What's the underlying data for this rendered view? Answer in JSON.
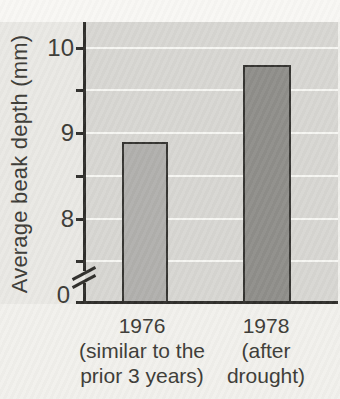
{
  "chart_data": {
    "type": "bar",
    "title": "",
    "xlabel": "",
    "ylabel": "Average beak depth (mm)",
    "categories": [
      "1976 (similar to the prior 3 years)",
      "1978 (after drought)"
    ],
    "values": [
      8.9,
      9.8
    ],
    "y_major_ticks": [
      10,
      9,
      8
    ],
    "y_minor_ticks": [
      9.5,
      8.5,
      7.5
    ],
    "baseline_tick_label": "0",
    "axis_break": "y-axis broken between 0 and 7.5",
    "ylim_shown": [
      7.5,
      10.3
    ],
    "grid": "white horizontal gridlines every 0.5 units on gray plot panel",
    "legend": "none",
    "bar_colors": [
      "#b0afac",
      "#8e8d89"
    ]
  },
  "y_axis": {
    "title": "Average beak depth (mm)",
    "zero_label": "0"
  },
  "x_axis": {
    "categories": [
      [
        "1976",
        "(similar to the",
        "prior 3 years)"
      ],
      [
        "1978",
        "(after",
        "drought)"
      ]
    ]
  },
  "colors": {
    "plot_background": "#d7d6d2",
    "left_margin_background": "#e9e8e4",
    "page_background": "#f1f0ec",
    "gridline": "#f6f6f2",
    "axis": "#2d2c29",
    "text": "#3b3a35",
    "bar_1976": "#b0afac",
    "bar_1978": "#8e8d89"
  }
}
